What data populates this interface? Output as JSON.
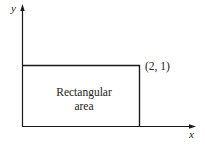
{
  "diagram": {
    "axes": {
      "x_label": "x",
      "y_label": "y"
    },
    "point_label": "(2, 1)",
    "region_label_line1": "Rectangular",
    "region_label_line2": "area",
    "stroke_color": "#1a1a1a"
  }
}
